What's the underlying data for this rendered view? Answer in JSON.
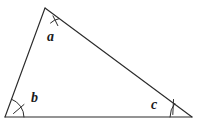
{
  "figure": {
    "kind": "geometry-diagram",
    "shape": "triangle",
    "background_color": "#ffffff",
    "stroke_color": "#2b2b2b",
    "label_color": "#1a1a1a",
    "width": 217,
    "height": 124
  },
  "triangle": {
    "vertices": [
      {
        "name": "apex",
        "x": 45,
        "y": 8
      },
      {
        "name": "bottom-left",
        "x": 5,
        "y": 117
      },
      {
        "name": "bottom-right",
        "x": 192,
        "y": 117
      }
    ],
    "edges": [
      {
        "name": "left-side",
        "from": "bottom-left",
        "to": "apex"
      },
      {
        "name": "hypotenuse",
        "from": "apex",
        "to": "bottom-right"
      },
      {
        "name": "base",
        "from": "bottom-left",
        "to": "bottom-right"
      }
    ]
  },
  "angles": [
    {
      "id": "a",
      "label": "a",
      "vertex": "apex",
      "arc_radius": 16,
      "tick_count": 1,
      "label_x": 47,
      "label_y": 30
    },
    {
      "id": "b",
      "label": "b",
      "vertex": "bottom-left",
      "arc_radius": 19,
      "tick_count": 1,
      "label_x": 31,
      "label_y": 91
    },
    {
      "id": "c",
      "label": "c",
      "vertex": "bottom-right",
      "arc_radius": 22,
      "tick_count": 1,
      "label_x": 151,
      "label_y": 98
    }
  ]
}
